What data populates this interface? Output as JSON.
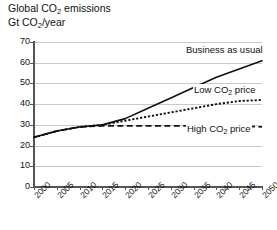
{
  "header": {
    "title": "Global CO2 emissions",
    "title_pre": "Global CO",
    "title_sub": "2",
    "title_post": " emissions",
    "subtitle": "Gt CO2/year",
    "subtitle_pre": "Gt CO",
    "subtitle_sub": "2",
    "subtitle_post": "/year"
  },
  "annotations": {
    "bau_pre": "Business as usual",
    "bau_sub": "",
    "bau_post": "",
    "low_pre": "Low CO",
    "low_sub": "2",
    "low_post": " price",
    "high_pre": "High CO",
    "high_sub": "2",
    "high_post": " price"
  },
  "axis": {
    "y_ticks": [
      "0",
      "10",
      "20",
      "30",
      "40",
      "50",
      "60",
      "70"
    ],
    "x_ticks": [
      "2000",
      "2005",
      "2010",
      "2015",
      "2020",
      "2025",
      "2030",
      "2035",
      "2040",
      "2045",
      "2050"
    ]
  },
  "chart_data": {
    "type": "line",
    "title": "Global CO2 emissions",
    "xlabel": "",
    "ylabel": "Gt CO2/year",
    "xlim": [
      2000,
      2050
    ],
    "ylim": [
      0,
      70
    ],
    "grid": true,
    "legend_position": "inline-annotations",
    "x": [
      2000,
      2005,
      2010,
      2015,
      2020,
      2025,
      2030,
      2035,
      2040,
      2045,
      2050
    ],
    "series": [
      {
        "name": "Business as usual",
        "style": "solid",
        "color": "#111111",
        "values": [
          24,
          27,
          29,
          30,
          33,
          38,
          43,
          48,
          53,
          57,
          61
        ]
      },
      {
        "name": "Low CO2 price",
        "style": "dotted",
        "color": "#111111",
        "values": [
          24,
          27,
          29,
          30,
          32,
          34,
          36,
          38,
          40,
          41.5,
          42
        ]
      },
      {
        "name": "High CO2 price",
        "style": "dashed",
        "color": "#111111",
        "values": [
          24,
          27,
          29,
          29.5,
          29.5,
          29.5,
          29.5,
          29.5,
          29.5,
          29.5,
          29
        ]
      }
    ]
  },
  "colors": {
    "grid": "#c9c9c9",
    "axis": "#555555",
    "line": "#111111",
    "background": "#ffffff"
  }
}
